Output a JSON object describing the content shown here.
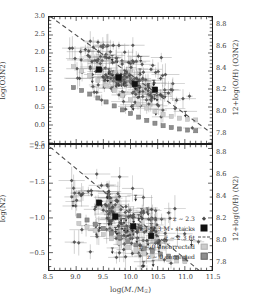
{
  "figure": {
    "xaxis": {
      "label": "log(M⋆/M☉)",
      "min": 8.5,
      "max": 11.5,
      "ticks": [
        8.5,
        9.0,
        9.5,
        10.0,
        10.5,
        11.0,
        11.5
      ],
      "ticklabels": [
        "8.5",
        "9.0",
        "9.5",
        "10.0",
        "10.5",
        "11.0",
        "11.5"
      ]
    },
    "panels": [
      {
        "id": "top",
        "left_axis": {
          "label": "log(O3N2)",
          "min": -0.5,
          "max": 3.0,
          "inverted": true,
          "ticks": [
            -0.5,
            0.0,
            0.5,
            1.0,
            1.5,
            2.0,
            2.5,
            3.0
          ],
          "ticklabels": [
            "−0.5",
            "0.0",
            "0.5",
            "1.0",
            "1.5",
            "2.0",
            "2.5",
            "3.0"
          ]
        },
        "right_axis": {
          "label": "12+log(O/H) (O3N2)",
          "min": 7.7,
          "max": 8.88,
          "ticks": [
            8.8,
            8.6,
            8.4,
            8.2,
            8.0,
            7.8
          ],
          "ticklabels": [
            "8.8",
            "8.6",
            "8.4",
            "8.2",
            "8.0",
            "7.8"
          ]
        }
      },
      {
        "id": "bottom",
        "left_axis": {
          "label": "log(N2)",
          "min": -2.05,
          "max": -0.25,
          "inverted": true,
          "ticks": [
            -0.5,
            -1.0,
            -1.5,
            -2.0
          ],
          "ticklabels": [
            "−0.5",
            "−1.0",
            "−1.5",
            "−2.0"
          ]
        },
        "right_axis": {
          "label": "12+log(O/H) (N2)",
          "min": 7.72,
          "max": 8.88,
          "ticks": [
            8.8,
            8.6,
            8.4,
            8.2,
            8.0,
            7.8
          ],
          "ticklabels": [
            "8.8",
            "8.6",
            "8.4",
            "8.2",
            "8.0",
            "7.8"
          ]
        }
      }
    ],
    "legend": {
      "items": [
        {
          "label": "z ∼ 2.3",
          "marker": "diamond"
        },
        {
          "label": "z ∼ 2.3 M⋆ stacks",
          "marker": "big-square"
        },
        {
          "label": "z ∼ 2.3 fit",
          "marker": "dashed-line"
        },
        {
          "label": "z ∼ 0 uncorrected",
          "marker": "light-square"
        },
        {
          "label": "z ∼ 0 corrected",
          "marker": "dark-square"
        }
      ]
    },
    "colors": {
      "z23_points": "#4a4a4a",
      "z23_stacks": "#111111",
      "fit_line": "#4f4f4f",
      "z0_uncorrected": "#cdcdcd",
      "z0_corrected": "#8e8e8e",
      "frame": "#1a1a1a"
    }
  },
  "chart_data": {
    "type": "scatter",
    "title": "",
    "xlabel": "log(M⋆/M☉)",
    "xlim": [
      8.5,
      11.5
    ],
    "grid": false,
    "legend_position": "bottom-right",
    "panels": [
      {
        "name": "top",
        "ylabel": "log(O3N2)",
        "ylim": [
          3.0,
          -0.5
        ],
        "y2label": "12+log(O/H) (O3N2)",
        "y2lim": [
          7.7,
          8.88
        ],
        "series": [
          {
            "name": "z ~ 0 uncorrected",
            "marker": "light-square",
            "x": [
              8.95,
              9.1,
              9.25,
              9.4,
              9.55,
              9.7,
              9.85,
              10.0,
              10.15,
              10.3,
              10.45,
              10.6,
              10.75,
              10.9,
              11.05,
              11.2
            ],
            "y": [
              1.62,
              1.5,
              1.38,
              1.24,
              1.1,
              0.96,
              0.82,
              0.7,
              0.58,
              0.47,
              0.38,
              0.3,
              0.24,
              0.19,
              0.16,
              0.14
            ]
          },
          {
            "name": "z ~ 0 corrected",
            "marker": "dark-square",
            "x": [
              8.95,
              9.1,
              9.25,
              9.4,
              9.55,
              9.7,
              9.85,
              10.0,
              10.15,
              10.3,
              10.45,
              10.6,
              10.75,
              10.9,
              11.05,
              11.2
            ],
            "y": [
              1.04,
              0.96,
              0.86,
              0.75,
              0.64,
              0.53,
              0.42,
              0.32,
              0.22,
              0.13,
              0.05,
              -0.02,
              -0.07,
              -0.11,
              -0.14,
              -0.16
            ]
          },
          {
            "name": "z ~ 2.3 M* stacks",
            "marker": "big-square",
            "x": [
              9.42,
              9.78,
              10.08,
              10.45
            ],
            "y": [
              1.54,
              1.32,
              1.14,
              0.98
            ]
          },
          {
            "name": "z ~ 2.3 fit",
            "marker": "dashed-line",
            "x": [
              8.52,
              11.45
            ],
            "y": [
              3.02,
              -0.18
            ]
          }
        ],
        "scatter_cloud": {
          "name": "z ~ 2.3",
          "n_points": 210,
          "x_center": 9.95,
          "x_spread": 0.45,
          "y_center": 1.3,
          "y_spread": 0.38,
          "slope": -0.55,
          "limit_arrow_fraction": 0.18
        }
      },
      {
        "name": "bottom",
        "ylabel": "log(N2)",
        "ylim": [
          -2.05,
          -0.25
        ],
        "y2label": "12+log(O/H) (N2)",
        "y2lim": [
          7.72,
          8.88
        ],
        "series": [
          {
            "name": "z ~ 0 uncorrected",
            "marker": "light-square",
            "x": [
              9.05,
              9.2,
              9.35,
              9.5,
              9.65,
              9.8,
              9.95,
              10.1,
              10.25,
              10.4,
              10.55,
              10.7,
              10.85,
              11.0
            ],
            "y": [
              -0.92,
              -0.87,
              -0.82,
              -0.76,
              -0.7,
              -0.64,
              -0.58,
              -0.53,
              -0.49,
              -0.45,
              -0.42,
              -0.4,
              -0.38,
              -0.37
            ]
          },
          {
            "name": "z ~ 0 corrected",
            "marker": "dark-square",
            "x": [
              9.05,
              9.2,
              9.35,
              9.5,
              9.65,
              9.8,
              9.95,
              10.1,
              10.25,
              10.4,
              10.55,
              10.7,
              10.85,
              11.0
            ],
            "y": [
              -1.03,
              -0.97,
              -0.91,
              -0.85,
              -0.78,
              -0.72,
              -0.66,
              -0.61,
              -0.56,
              -0.52,
              -0.48,
              -0.45,
              -0.43,
              -0.41
            ]
          },
          {
            "name": "z ~ 2.3 M* stacks",
            "marker": "big-square",
            "x": [
              9.42,
              9.72,
              10.05,
              10.38
            ],
            "y": [
              -1.22,
              -1.02,
              -0.88,
              -0.74
            ]
          },
          {
            "name": "z ~ 2.3 fit",
            "marker": "dashed-line",
            "x": [
              8.52,
              11.3
            ],
            "y": [
              -2.02,
              -0.22
            ]
          }
        ],
        "scatter_cloud": {
          "name": "z ~ 2.3",
          "n_points": 205,
          "x_center": 9.92,
          "x_spread": 0.44,
          "y_center": -0.92,
          "y_spread": 0.26,
          "slope": 0.3,
          "limit_arrow_fraction": 0.22
        }
      }
    ]
  }
}
